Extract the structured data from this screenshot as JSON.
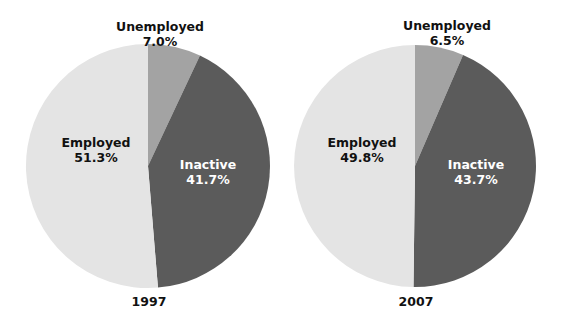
{
  "colors": {
    "Employed": "#e4e4e4",
    "Unemployed": "#a3a3a3",
    "Inactive": "#5b5b5b",
    "background": "#ffffff"
  },
  "chart_data": [
    {
      "type": "pie",
      "title": "1997",
      "categories": [
        "Unemployed",
        "Inactive",
        "Employed"
      ],
      "values": [
        7.0,
        41.7,
        51.3
      ],
      "labels": [
        "Unemployed\n7.0%",
        "Inactive\n41.7%",
        "Employed\n51.3%"
      ],
      "start_angle": "12 o'clock, clockwise",
      "legend": "none (labels on slices)"
    },
    {
      "type": "pie",
      "title": "2007",
      "categories": [
        "Unemployed",
        "Inactive",
        "Employed"
      ],
      "values": [
        6.5,
        43.7,
        49.8
      ],
      "labels": [
        "Unemployed\n6.5%",
        "Inactive\n43.7%",
        "Employed\n49.8%"
      ],
      "start_angle": "12 o'clock, clockwise",
      "legend": "none (labels on slices)"
    }
  ],
  "pies": [
    {
      "year": "1997",
      "unemployed": {
        "name": "Unemployed",
        "pct": "7.0%"
      },
      "inactive": {
        "name": "Inactive",
        "pct": "41.7%"
      },
      "employed": {
        "name": "Employed",
        "pct": "51.3%"
      }
    },
    {
      "year": "2007",
      "unemployed": {
        "name": "Unemployed",
        "pct": "6.5%"
      },
      "inactive": {
        "name": "Inactive",
        "pct": "43.7%"
      },
      "employed": {
        "name": "Employed",
        "pct": "49.8%"
      }
    }
  ]
}
